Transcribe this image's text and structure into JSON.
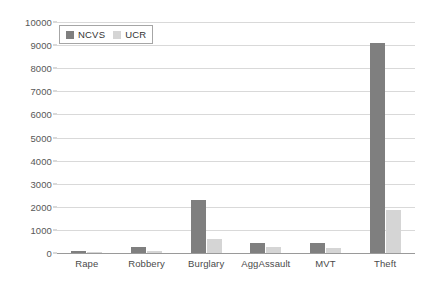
{
  "chart_data": {
    "type": "bar",
    "title": "",
    "subtitle": "",
    "xlabel": "",
    "ylabel": "",
    "categories": [
      "Rape",
      "Robbery",
      "Burglary",
      "AggAssault",
      "MVT",
      "Theft"
    ],
    "series": [
      {
        "name": "NCVS",
        "color": "#7f7f7f",
        "values": [
          90,
          250,
          2300,
          430,
          430,
          9100
        ]
      },
      {
        "name": "UCR",
        "color": "#d5d5d5",
        "values": [
          30,
          100,
          600,
          250,
          200,
          1850
        ]
      }
    ],
    "ylim": [
      0,
      10000
    ],
    "ytick_step": 1000,
    "ytick_labels": [
      "0",
      "1000",
      "2000",
      "3000",
      "4000",
      "5000",
      "6000",
      "7000",
      "8000",
      "9000",
      "10000"
    ],
    "grid": true,
    "grid_axis": "y",
    "legend_position": "top-left",
    "legend_entries": [
      "NCVS",
      "UCR"
    ],
    "annotations": []
  },
  "legend": {
    "items": [
      {
        "label": "NCVS",
        "swatch": "ncvs"
      },
      {
        "label": "UCR",
        "swatch": "ucr"
      }
    ]
  }
}
